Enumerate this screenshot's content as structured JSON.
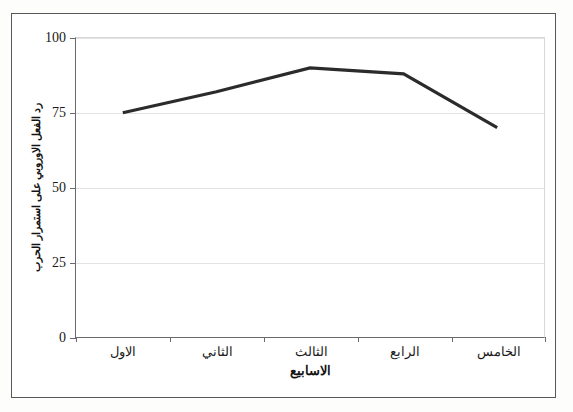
{
  "chart_data": {
    "type": "line",
    "title": "",
    "categories": [
      "الاول",
      "الثاني",
      "الثالث",
      "الرابع",
      "الخامس"
    ],
    "values": [
      75,
      82,
      90,
      88,
      70
    ],
    "series": [
      {
        "name": "رد الفعل الاوروبي على استمرار الحرب",
        "values": [
          75,
          82,
          90,
          88,
          70
        ],
        "color": "#2b2b2b"
      }
    ],
    "xlabel": "الاسابيع",
    "ylabel": "رد الفعل الاوروبي على استمرار الحرب",
    "ylim": [
      0,
      100
    ],
    "yticks": [
      0,
      25,
      50,
      75,
      100
    ],
    "ytick_labels": [
      "0",
      "25",
      "50",
      "75",
      "100"
    ],
    "grid": true,
    "grid_axis": "y",
    "legend": "none",
    "line_color": "#2b2b2b",
    "grid_color": "#e3e3e3",
    "axis_color": "#6a6a6c",
    "frame_color": "#58585a",
    "background": "#ffffff"
  },
  "axes": {
    "y_tick_0": "0",
    "y_tick_1": "25",
    "y_tick_2": "50",
    "y_tick_3": "75",
    "y_tick_4": "100",
    "x_tick_0": "الاول",
    "x_tick_1": "الثاني",
    "x_tick_2": "الثالث",
    "x_tick_3": "الرابع",
    "x_tick_4": "الخامس",
    "x_title": "الاسابيع",
    "y_title": "رد الفعل الاوروبي على استمرار الحرب"
  }
}
